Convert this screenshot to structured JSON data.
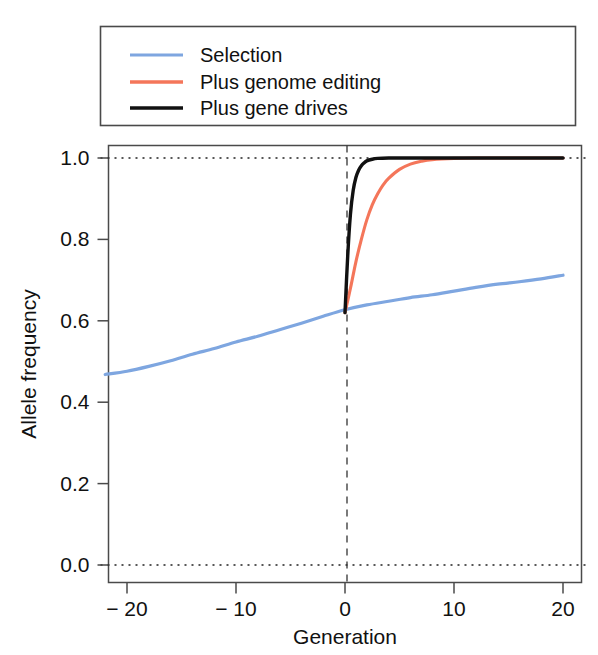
{
  "chart_data": {
    "type": "line",
    "title": "",
    "subtitle": "",
    "xlabel": "Generation",
    "ylabel": "Allele frequency",
    "xlim": [
      -22,
      20
    ],
    "ylim": [
      0.0,
      1.0
    ],
    "xticks": [
      -20,
      -10,
      0,
      10,
      20
    ],
    "xtick_labels": [
      "− 20",
      "− 10",
      "0",
      "10",
      "20"
    ],
    "yticks": [
      0.0,
      0.2,
      0.4,
      0.6,
      0.8,
      1.0
    ],
    "ytick_labels": [
      "0.0",
      "0.2",
      "0.4",
      "0.6",
      "0.8",
      "1.0"
    ],
    "grid": "horizontal-dotted-at-0-and-1",
    "gridlines_y": [
      0.0,
      1.0
    ],
    "vline_x": 0,
    "legend_position": "above-plot",
    "series": [
      {
        "name": "Selection",
        "color": "#7EA6E0",
        "x": [
          -22,
          -20,
          -18,
          -16,
          -14,
          -12,
          -10,
          -8,
          -6,
          -4,
          -2,
          0,
          2,
          4,
          6,
          8,
          10,
          12,
          14,
          16,
          18,
          20
        ],
        "values": [
          0.468,
          0.476,
          0.488,
          0.502,
          0.518,
          0.532,
          0.548,
          0.562,
          0.578,
          0.594,
          0.611,
          0.627,
          0.639,
          0.648,
          0.657,
          0.664,
          0.673,
          0.682,
          0.69,
          0.696,
          0.703,
          0.712
        ]
      },
      {
        "name": "Plus genome editing",
        "color": "#F4765A",
        "x": [
          0,
          0.5,
          1,
          1.5,
          2,
          2.5,
          3,
          3.5,
          4,
          5,
          6,
          7,
          8,
          10,
          12,
          14,
          16,
          18,
          20
        ],
        "values": [
          0.62,
          0.68,
          0.745,
          0.8,
          0.848,
          0.885,
          0.912,
          0.934,
          0.95,
          0.972,
          0.985,
          0.992,
          0.996,
          0.999,
          1.0,
          1.0,
          1.0,
          1.0,
          1.0
        ]
      },
      {
        "name": "Plus gene drives",
        "color": "#111111",
        "x": [
          0,
          0.25,
          0.5,
          0.75,
          1,
          1.25,
          1.5,
          1.75,
          2,
          2.5,
          3,
          4,
          6,
          8,
          10,
          14,
          18,
          20
        ],
        "values": [
          0.62,
          0.76,
          0.862,
          0.92,
          0.952,
          0.97,
          0.981,
          0.988,
          0.993,
          0.997,
          0.999,
          1.0,
          1.0,
          1.0,
          1.0,
          1.0,
          1.0,
          1.0
        ]
      }
    ]
  },
  "legend": {
    "items": [
      {
        "label": "Selection",
        "color": "#7EA6E0"
      },
      {
        "label": "Plus genome editing",
        "color": "#F4765A"
      },
      {
        "label": "Plus gene drives",
        "color": "#111111"
      }
    ]
  },
  "axes": {
    "x_title": "Generation",
    "y_title": "Allele frequency"
  }
}
